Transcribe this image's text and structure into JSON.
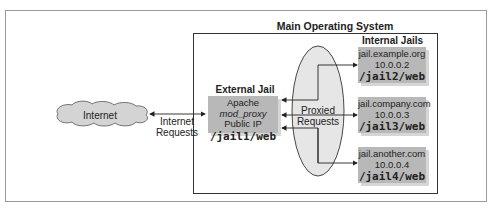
{
  "diagram": {
    "main_os_title": "Main Operating System",
    "internet": {
      "label": "Internet",
      "requests_label_line1": "Internet",
      "requests_label_line2": "Requests"
    },
    "external_jail": {
      "title": "External Jail",
      "line1_prefix": "Apache ",
      "line1_italic": "mod_proxy",
      "line2": "Public IP",
      "path": "/jail1/web"
    },
    "proxied": {
      "line1": "Proxied",
      "line2": "Requests"
    },
    "internal_jails": {
      "title": "Internal Jails",
      "items": [
        {
          "host": "jail.example.org",
          "ip": "10.0.0.2",
          "path": "/jail2/web"
        },
        {
          "host": "jail.company.com",
          "ip": "10.0.0.3",
          "path": "/jail3/web"
        },
        {
          "host": "jail.another.com",
          "ip": "10.0.0.4",
          "path": "/jail4/web"
        }
      ]
    },
    "colors": {
      "box_fill": "#b8b8b8",
      "box_shadow": "#d6d6d6",
      "cloud_fill": "#d4d4d4",
      "ellipse_fill": "#e6e6e6",
      "line": "#333333"
    }
  }
}
